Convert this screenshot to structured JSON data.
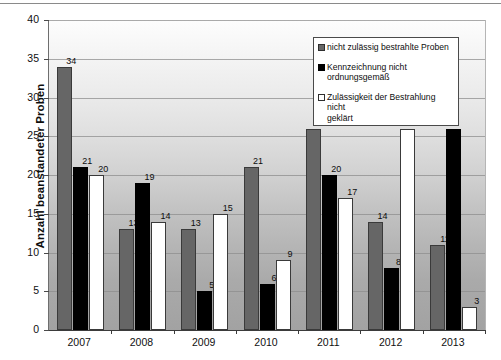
{
  "chart_data": {
    "type": "bar",
    "title": "",
    "subtitle": "",
    "xlabel": "",
    "ylabel": "Anzahl beanstandeter Proben",
    "categories": [
      "2007",
      "2008",
      "2009",
      "2010",
      "2011",
      "2012",
      "2013"
    ],
    "series": [
      {
        "name": "nicht zulässig bestrahlte Proben",
        "color": "#666666",
        "values": [
          34,
          13,
          13,
          21,
          26,
          14,
          11
        ]
      },
      {
        "name": "Kennzeichnung nicht ordnungsgemäß",
        "color": "#000000",
        "values": [
          21,
          19,
          5,
          6,
          20,
          8,
          26
        ]
      },
      {
        "name": "Zulässigkeit der Bestrahlung nicht geklärt",
        "color": "#ffffff",
        "values": [
          20,
          14,
          15,
          9,
          17,
          26,
          3
        ]
      }
    ],
    "visible_value_labels": {
      "2007": [
        "34",
        "21",
        "20"
      ],
      "2008": [
        "13",
        "19",
        "14"
      ],
      "2009": [
        "13",
        "5",
        "15"
      ],
      "2010": [
        "21",
        "6",
        "9"
      ],
      "2011": [
        "",
        "20",
        "17"
      ],
      "2012": [
        "14",
        "8",
        ""
      ],
      "2013": [
        "11",
        "",
        "3"
      ]
    },
    "ylim": [
      0,
      40
    ],
    "ytick_step": 5,
    "yticks": [
      "0",
      "5",
      "10",
      "15",
      "20",
      "25",
      "30",
      "35",
      "40"
    ],
    "grid": true,
    "legend_position": "top-right",
    "plot_background": "vertical-gradient-light-to-gray"
  },
  "legend": {
    "entries": [
      {
        "label_line1": "nicht zulässig bestrahlte Proben",
        "label_line2": "",
        "swatch": "gray-swatch"
      },
      {
        "label_line1": "Kennzeichnung nicht",
        "label_line2": "ordnungsgemäß",
        "swatch": "black-swatch"
      },
      {
        "label_line1": "Zulässigkeit der Bestrahlung nicht",
        "label_line2": "geklärt",
        "swatch": "white-swatch"
      }
    ]
  },
  "axis": {
    "y_title": "Anzahl beanstandeter Proben"
  }
}
